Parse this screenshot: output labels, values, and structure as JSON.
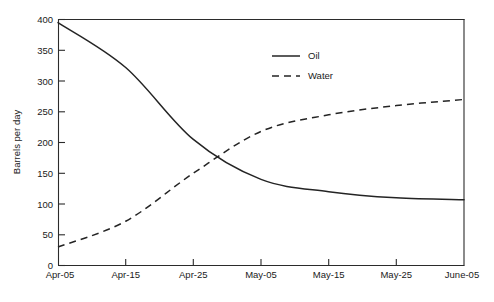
{
  "chart_data": {
    "type": "line",
    "title": "",
    "xlabel": "",
    "ylabel": "Barrels per day",
    "x": [
      "Apr-05",
      "Apr-15",
      "Apr-25",
      "May-05",
      "May-15",
      "May-25",
      "June-05"
    ],
    "xlim": [
      0,
      6
    ],
    "ylim": [
      0,
      400
    ],
    "y_ticks": [
      0,
      50,
      100,
      150,
      200,
      250,
      300,
      350,
      400
    ],
    "x_ticks": [
      "Apr-05",
      "Apr-15",
      "Apr-25",
      "May-05",
      "May-15",
      "May-25",
      "June-05"
    ],
    "grid": false,
    "legend_position": "top-center-right",
    "series": [
      {
        "name": "Oil",
        "style": "solid",
        "color": "#242424",
        "values": [
          395,
          322,
          205,
          140,
          120,
          110,
          107
        ]
      },
      {
        "name": "Water",
        "style": "dashed",
        "color": "#242424",
        "values": [
          30,
          72,
          150,
          218,
          245,
          260,
          270
        ]
      }
    ],
    "annotations": []
  },
  "legend": {
    "items": [
      {
        "label": "Oil",
        "style": "solid"
      },
      {
        "label": "Water",
        "style": "dashed"
      }
    ]
  },
  "axes": {
    "y_title": "Barrels per day",
    "y_tick_labels": [
      "400",
      "350",
      "300",
      "250",
      "200",
      "150",
      "100",
      "50",
      "0"
    ],
    "x_tick_labels": [
      "Apr-05",
      "Apr-15",
      "Apr-25",
      "May-05",
      "May-15",
      "May-25",
      "June-05"
    ]
  }
}
